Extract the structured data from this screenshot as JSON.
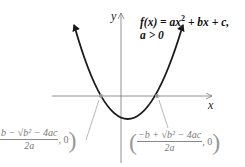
{
  "diagram": {
    "equation": {
      "line1_prefix": "f(x) = ax",
      "line1_exp": "2",
      "line1_suffix": " + bx + c,",
      "line2": "a > 0"
    },
    "axes": {
      "x_label": "x",
      "y_label": "y"
    },
    "roots": {
      "left": {
        "numerator": "b − √b² − 4ac",
        "denominator": "2a",
        "tail": ", 0",
        "close": ")"
      },
      "right": {
        "open": "(",
        "numerator": "−b + √b² − 4ac",
        "denominator": "2a",
        "tail": ", 0",
        "close": ")"
      }
    },
    "colors": {
      "curve": "#1a1a1a",
      "axes": "#777777",
      "pointer": "#999999",
      "root_dot": "#999999"
    }
  }
}
